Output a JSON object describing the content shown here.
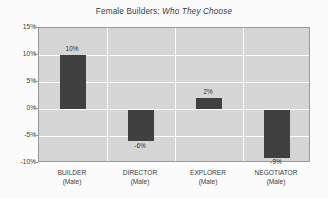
{
  "chart_data": {
    "type": "bar",
    "title": "Female Builders: Who They Choose",
    "title_plain": "Female Builders:",
    "title_italic": "Who They Choose",
    "xlabel": "",
    "ylabel": "",
    "categories": [
      "BUILDER",
      "DIRECTOR",
      "EXPLORER",
      "NEGOTIATOR"
    ],
    "category_subtitles": [
      "(Male)",
      "(Male)",
      "(Male)",
      "(Male)"
    ],
    "values": [
      10,
      -6,
      2,
      -9
    ],
    "value_labels": [
      "10%",
      "-6%",
      "2%",
      "-9%"
    ],
    "ylim": [
      -10,
      15
    ],
    "ytick_values": [
      15,
      10,
      5,
      0,
      -5,
      -10
    ],
    "ytick_labels": [
      "15%",
      "10%",
      "5%",
      "0%",
      "-5%",
      "-10%"
    ],
    "grid": true,
    "legend": false,
    "bar_color": "#404040",
    "plot_background": "#d5d5d5",
    "gridline_color": "#ffffff",
    "axis_color": "#9a9a9a",
    "page_background": "#fbfbfb"
  }
}
